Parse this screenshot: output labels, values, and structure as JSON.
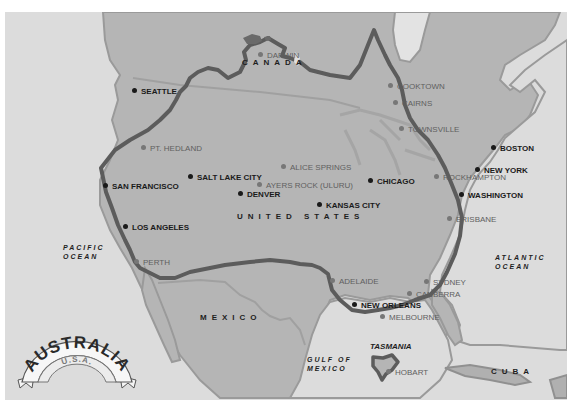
{
  "map": {
    "title": "Australia vs U.S.A. size comparison",
    "badge": {
      "title": "AUSTRALIA",
      "subtitle": "U.S.A."
    },
    "countries": [
      {
        "label": "CANADA",
        "x": 242,
        "y": 58
      },
      {
        "label": "UNITED STATES",
        "x": 237,
        "y": 212
      },
      {
        "label": "MEXICO",
        "x": 200,
        "y": 313
      },
      {
        "label": "CUBA",
        "x": 491,
        "y": 367
      }
    ],
    "oceans": [
      {
        "line1": "PACIFIC",
        "line2": "OCEAN",
        "x": 57,
        "y": 246
      },
      {
        "line1": "ATLANTIC",
        "line2": "OCEAN",
        "x": 494,
        "y": 253
      },
      {
        "line1": "GULF OF",
        "line2": "MEXICO",
        "x": 305,
        "y": 355
      }
    ],
    "us_cities": [
      {
        "name": "SEATTLE",
        "x": 134,
        "y": 87
      },
      {
        "name": "SAN FRANCISCO",
        "x": 104,
        "y": 181
      },
      {
        "name": "SALT LAKE CITY",
        "x": 189,
        "y": 173
      },
      {
        "name": "DENVER",
        "x": 239,
        "y": 190
      },
      {
        "name": "KANSAS CITY",
        "x": 318,
        "y": 201
      },
      {
        "name": "CHICAGO",
        "x": 369,
        "y": 176
      },
      {
        "name": "LOS ANGELES",
        "x": 124,
        "y": 223
      },
      {
        "name": "BOSTON",
        "x": 493,
        "y": 143
      },
      {
        "name": "NEW YORK",
        "x": 476,
        "y": 165
      },
      {
        "name": "WASHINGTON",
        "x": 460,
        "y": 190
      },
      {
        "name": "NEW ORLEANS",
        "x": 353,
        "y": 300
      }
    ],
    "au_cities": [
      {
        "name": "DARWIN",
        "x": 259,
        "y": 50
      },
      {
        "name": "COOKTOWN",
        "x": 389,
        "y": 81
      },
      {
        "name": "CAIRNS",
        "x": 394,
        "y": 98
      },
      {
        "name": "TOWNSVILLE",
        "x": 400,
        "y": 124
      },
      {
        "name": "PT. HEDLAND",
        "x": 142,
        "y": 143
      },
      {
        "name": "ALICE SPRINGS",
        "x": 282,
        "y": 162
      },
      {
        "name": "AYERS ROCK (ULURU)",
        "x": 258,
        "y": 180
      },
      {
        "name": "ROCKHAMPTON",
        "x": 435,
        "y": 172
      },
      {
        "name": "BRISBANE",
        "x": 448,
        "y": 214
      },
      {
        "name": "PERTH",
        "x": 135,
        "y": 257
      },
      {
        "name": "ADELAIDE",
        "x": 331,
        "y": 276
      },
      {
        "name": "SYDNEY",
        "x": 425,
        "y": 277
      },
      {
        "name": "CANBERRA",
        "x": 408,
        "y": 289
      },
      {
        "name": "MELBOURNE",
        "x": 381,
        "y": 312
      },
      {
        "name": "HOBART",
        "x": 387,
        "y": 367
      }
    ],
    "tasmania": {
      "label": "TASMANIA",
      "x": 370,
      "y": 342
    },
    "colors": {
      "ocean": "#dcdcdc",
      "land_us": "#b3b3b3",
      "land_other": "#b9b9b9",
      "border": "#979797",
      "australia_outline": "#5a5a5a",
      "us_city": "#1a1a1a",
      "au_city": "#6e6e6e"
    }
  }
}
